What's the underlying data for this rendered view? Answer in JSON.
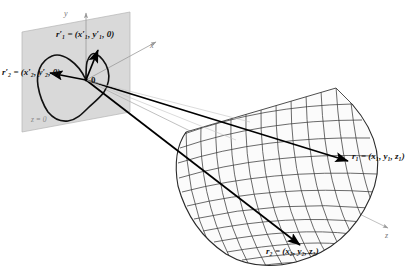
{
  "figure": {
    "background_color": "#ffffff",
    "plane_fill_color": "#d8d8d8",
    "mesh_color": "#333333",
    "ray_color": "#000000",
    "axis_color": "#9a9a9a"
  },
  "axes": {
    "y_label": "y",
    "x_label": "x",
    "z_label": "z"
  },
  "plane": {
    "equation_label": "z = 0",
    "origin_label": "0"
  },
  "vectors": {
    "r1_prime": {
      "name": "r1-prime",
      "symbol": "r",
      "subscript": "1",
      "prime": "′",
      "equals": "=",
      "components": "(x′₁, y′₁, 0)",
      "full_text": "r′₁ = (x′₁, y′₁, 0)"
    },
    "r2_prime": {
      "name": "r2-prime",
      "symbol": "r",
      "subscript": "2",
      "prime": "′",
      "equals": "=",
      "components": "(x′₂, y′₂, 0)",
      "full_text": "r′₂ = (x′₂, y′₂, 0)"
    },
    "r1": {
      "name": "r1",
      "symbol": "r",
      "subscript": "1",
      "equals": "=",
      "components": "(x₁, y₁, z₁)",
      "full_text": "r₁ = (x₁, y₁, z₁)"
    },
    "r2": {
      "name": "r2",
      "symbol": "r",
      "subscript": "2",
      "equals": "=",
      "components": "(x₂, y₂, z₂)",
      "full_text": "r₂ = (x₂, y₂, z₂)"
    }
  },
  "labels": {
    "r1_prime_text": "r′",
    "r1_prime_sub": "1",
    "r1_prime_rest": "=(x′, y′, 0)",
    "r2_prime_text": "r′",
    "r2_prime_sub": "2",
    "r1_text": "r",
    "r2_text": "r"
  }
}
